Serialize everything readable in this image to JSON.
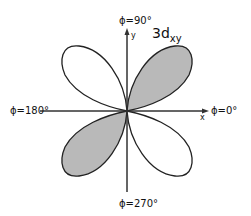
{
  "title": {
    "main": "3d",
    "subscript": "xy"
  },
  "axes": {
    "x_label": "x",
    "y_label": "y"
  },
  "angle_labels": {
    "top": "ϕ=90°",
    "right": "ϕ=0°",
    "left": "ϕ=180°",
    "bottom": "ϕ=270°"
  },
  "lobes": [
    {
      "name": "upper-right",
      "shaded": true
    },
    {
      "name": "upper-left",
      "shaded": false
    },
    {
      "name": "lower-left",
      "shaded": true
    },
    {
      "name": "lower-right",
      "shaded": false
    }
  ],
  "colors": {
    "shaded_fill": "#b9b9b9",
    "outline": "#222222",
    "axis": "#333333"
  }
}
